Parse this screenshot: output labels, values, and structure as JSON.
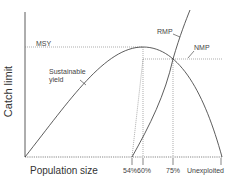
{
  "diagram": {
    "y_axis_label": "Catch limit",
    "x_axis_label": "Population size",
    "curves": [
      {
        "name": "Sustainable yield",
        "label": "Sustainable\nyield"
      },
      {
        "name": "RMP",
        "label": "RMP"
      },
      {
        "name": "NMP",
        "label": "NMP"
      }
    ],
    "annotations": {
      "msy": "MSY",
      "sustainable_line1": "Sustainable",
      "sustainable_line2": "yield",
      "rmp": "RMP",
      "nmp": "NMP"
    },
    "x_ticks": [
      "54%",
      "60%",
      "75%",
      "Unexploited"
    ],
    "colors": {
      "line": "#333333",
      "dotted": "#666666",
      "background": "#ffffff"
    }
  }
}
